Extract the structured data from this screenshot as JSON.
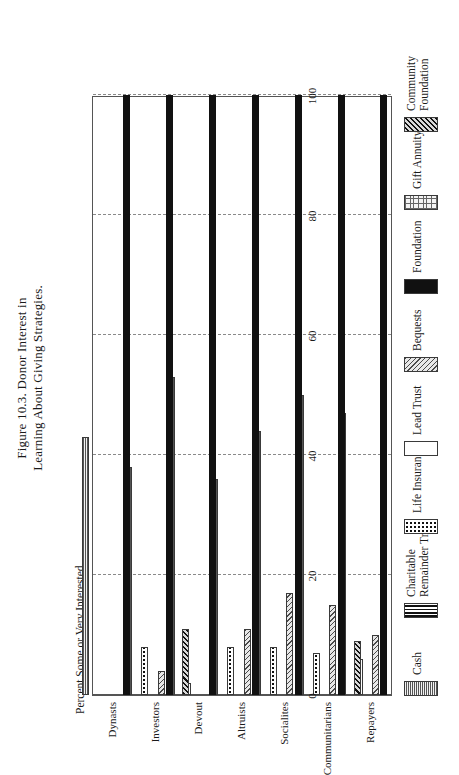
{
  "figure": {
    "title_line1": "Figure 10.3. Donor Interest in",
    "title_line2": "Learning About Giving Strategies."
  },
  "axes": {
    "ylabel": "Percent Some or Very Interested",
    "yticks": [
      "0",
      "20",
      "40",
      "60",
      "80",
      "100"
    ],
    "categories": [
      "Repayers",
      "Communitarians",
      "Socialites",
      "Altruists",
      "Devout",
      "Investors",
      "Dynasts"
    ]
  },
  "legend": {
    "items": [
      {
        "label_line1": "Cash",
        "label_line2": "",
        "pattern": "cash-swatch"
      },
      {
        "label_line1": "Charitable",
        "label_line2": "Remainder Trust",
        "pattern": "charitable-remainder-trust-swatch"
      },
      {
        "label_line1": "Life Insurance",
        "label_line2": "",
        "pattern": "life-insurance-swatch"
      },
      {
        "label_line1": "Lead Trust",
        "label_line2": "",
        "pattern": "lead-trust-swatch"
      },
      {
        "label_line1": "Bequests",
        "label_line2": "",
        "pattern": "bequests-swatch"
      },
      {
        "label_line1": "Foundation",
        "label_line2": "",
        "pattern": "foundation-swatch"
      },
      {
        "label_line1": "Gift Annuity",
        "label_line2": "",
        "pattern": "gift-annuity-swatch"
      },
      {
        "label_line1": "Community",
        "label_line2": "Foundation",
        "pattern": "community-foundation-swatch"
      }
    ]
  },
  "chart_data": {
    "type": "bar",
    "orientation": "horizontal",
    "title": "Figure 10.3. Donor Interest in Learning About Giving Strategies.",
    "xlabel": "",
    "ylabel": "Percent Some or Very Interested",
    "ylim": [
      0,
      100
    ],
    "yticks": [
      0,
      20,
      40,
      60,
      80,
      100
    ],
    "grid": "dashed vertical gridlines at each tick",
    "legend_position": "below plot, two rows of four",
    "categories": [
      "Repayers",
      "Communitarians",
      "Socialites",
      "Altruists",
      "Devout",
      "Investors",
      "Dynasts"
    ],
    "series": [
      {
        "name": "Cash",
        "values": [
          47,
          50,
          44,
          36,
          53,
          38,
          43
        ]
      },
      {
        "name": "Charitable Remainder Trust",
        "values": [
          0,
          0,
          0,
          0,
          0,
          0,
          0
        ]
      },
      {
        "name": "Life Insurance",
        "values": [
          6,
          7,
          8,
          8,
          2,
          8,
          0
        ]
      },
      {
        "name": "Lead Trust",
        "values": [
          0,
          0,
          0,
          0,
          0,
          0,
          0
        ]
      },
      {
        "name": "Bequests",
        "values": [
          10,
          15,
          17,
          11,
          0,
          4,
          0
        ]
      },
      {
        "name": "Foundation",
        "values": [
          100,
          100,
          100,
          100,
          100,
          100,
          100
        ]
      },
      {
        "name": "Gift Annuity",
        "values": [
          0,
          0,
          0,
          0,
          0,
          0,
          0
        ]
      },
      {
        "name": "Community Foundation",
        "values": [
          0,
          9,
          0,
          0,
          0,
          11,
          0
        ]
      }
    ]
  }
}
